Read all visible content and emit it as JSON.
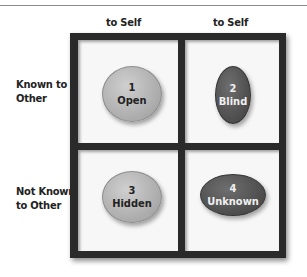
{
  "columns": [
    {
      "label": "to Self"
    },
    {
      "label": "to Self"
    }
  ],
  "rows": [
    {
      "label_line1": "Known to",
      "label_line2": "Other"
    },
    {
      "label_line1": "Not Known",
      "label_line2": "to Other"
    }
  ],
  "quadrants": [
    {
      "number": "1",
      "name": "Open",
      "shade": "light"
    },
    {
      "number": "2",
      "name": "Blind",
      "shade": "dark"
    },
    {
      "number": "3",
      "name": "Hidden",
      "shade": "light"
    },
    {
      "number": "4",
      "name": "Unknown",
      "shade": "dark"
    }
  ],
  "colors": {
    "frame": "#2a2a2a",
    "light_oval": "#b4b4b4",
    "dark_oval": "#555555",
    "cell_bg": "#f7f7f7"
  }
}
